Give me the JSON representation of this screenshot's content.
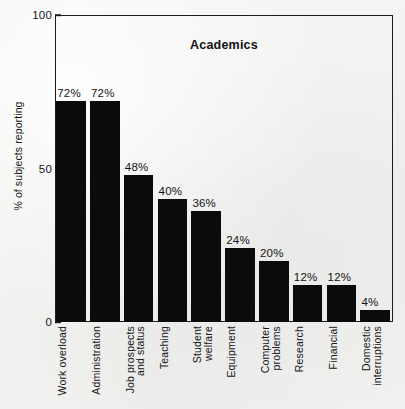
{
  "chart_data": {
    "type": "bar",
    "title": "Academics",
    "xlabel": "",
    "ylabel": "% of subjects reporting",
    "ylim": [
      0,
      100
    ],
    "yticks": [
      "0",
      "50",
      "100"
    ],
    "ytick_values": [
      0,
      50,
      100
    ],
    "grid": false,
    "legend": false,
    "orientation": "vertical",
    "bar_color": "#0b0b0b",
    "background_color": "#f1f1f0",
    "axis_color": "#1c1c1c",
    "categories": [
      "Work overload",
      "Administration",
      "Job prospects and status",
      "Teaching",
      "Student welfare",
      "Equipment",
      "Computer problems",
      "Research",
      "Financial",
      "Domestic interruptions"
    ],
    "category_lines": [
      [
        "Work overload"
      ],
      [
        "Administration"
      ],
      [
        "Job prospects",
        "and status"
      ],
      [
        "Teaching"
      ],
      [
        "Student",
        "welfare"
      ],
      [
        "Equipment"
      ],
      [
        "Computer",
        "problems"
      ],
      [
        "Research"
      ],
      [
        "Financial"
      ],
      [
        "Domestic",
        "interruptions"
      ]
    ],
    "values": [
      72,
      72,
      48,
      40,
      36,
      24,
      20,
      12,
      12,
      4
    ],
    "value_labels": [
      "72%",
      "72%",
      "48%",
      "40%",
      "36%",
      "24%",
      "20%",
      "12%",
      "12%",
      "4%"
    ]
  }
}
